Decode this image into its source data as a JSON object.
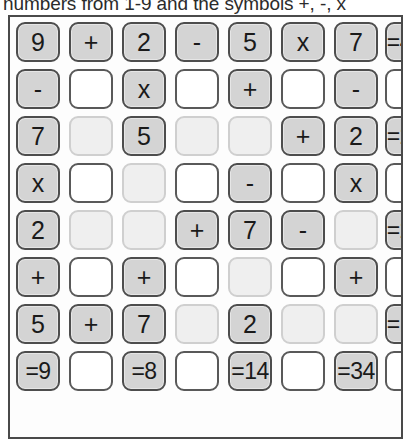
{
  "instruction": {
    "text": "se numbers from 1-9 and the symbols +, -, x"
  },
  "puzzle": {
    "title": "cross-number-puzzle-grid",
    "columns": 8,
    "rows": 8,
    "colors": {
      "given_fill": "#d4d4d4",
      "given_border": "#4d4d4d",
      "blank_faint_fill": "#efefef",
      "blank_faint_border": "#cfcfcf",
      "blank_white_fill": "#ffffff",
      "blank_white_border": "#595959",
      "frame_border": "#4a4a4a",
      "text": "#1a1a1a"
    },
    "grid": [
      [
        {
          "text": "9",
          "kind": "given"
        },
        {
          "text": "+",
          "kind": "given"
        },
        {
          "text": "2",
          "kind": "given"
        },
        {
          "text": "-",
          "kind": "given"
        },
        {
          "text": "5",
          "kind": "given"
        },
        {
          "text": "x",
          "kind": "given"
        },
        {
          "text": "7",
          "kind": "given"
        },
        {
          "text": "=42",
          "kind": "given"
        }
      ],
      [
        {
          "text": "-",
          "kind": "given"
        },
        {
          "text": "",
          "kind": "blank-white"
        },
        {
          "text": "x",
          "kind": "given"
        },
        {
          "text": "",
          "kind": "blank-white"
        },
        {
          "text": "+",
          "kind": "given"
        },
        {
          "text": "",
          "kind": "blank-white"
        },
        {
          "text": "-",
          "kind": "given"
        },
        {
          "text": "",
          "kind": "blank-white"
        }
      ],
      [
        {
          "text": "7",
          "kind": "given"
        },
        {
          "text": "",
          "kind": "blank-faint"
        },
        {
          "text": "5",
          "kind": "given"
        },
        {
          "text": "",
          "kind": "blank-faint"
        },
        {
          "text": "",
          "kind": "blank-faint"
        },
        {
          "text": "+",
          "kind": "given"
        },
        {
          "text": "2",
          "kind": "given"
        },
        {
          "text": "=20",
          "kind": "given"
        }
      ],
      [
        {
          "text": "x",
          "kind": "given"
        },
        {
          "text": "",
          "kind": "blank-white"
        },
        {
          "text": "",
          "kind": "blank-faint"
        },
        {
          "text": "",
          "kind": "blank-white"
        },
        {
          "text": "-",
          "kind": "given"
        },
        {
          "text": "",
          "kind": "blank-white"
        },
        {
          "text": "x",
          "kind": "given"
        },
        {
          "text": "",
          "kind": "blank-white"
        }
      ],
      [
        {
          "text": "2",
          "kind": "given"
        },
        {
          "text": "",
          "kind": "blank-faint"
        },
        {
          "text": "",
          "kind": "blank-faint"
        },
        {
          "text": "+",
          "kind": "given"
        },
        {
          "text": "7",
          "kind": "given"
        },
        {
          "text": "-",
          "kind": "given"
        },
        {
          "text": "",
          "kind": "blank-faint"
        },
        {
          "text": "=20",
          "kind": "given"
        }
      ],
      [
        {
          "text": "+",
          "kind": "given"
        },
        {
          "text": "",
          "kind": "blank-white"
        },
        {
          "text": "+",
          "kind": "given"
        },
        {
          "text": "",
          "kind": "blank-white"
        },
        {
          "text": "",
          "kind": "blank-faint"
        },
        {
          "text": "",
          "kind": "blank-white"
        },
        {
          "text": "+",
          "kind": "given"
        },
        {
          "text": "",
          "kind": "blank-white"
        }
      ],
      [
        {
          "text": "5",
          "kind": "given"
        },
        {
          "text": "+",
          "kind": "given"
        },
        {
          "text": "7",
          "kind": "given"
        },
        {
          "text": "",
          "kind": "blank-faint"
        },
        {
          "text": "2",
          "kind": "given"
        },
        {
          "text": "",
          "kind": "blank-faint"
        },
        {
          "text": "",
          "kind": "blank-faint"
        },
        {
          "text": "=15",
          "kind": "given"
        }
      ],
      [
        {
          "text": "=9",
          "kind": "given"
        },
        {
          "text": "",
          "kind": "blank-white"
        },
        {
          "text": "=8",
          "kind": "given"
        },
        {
          "text": "",
          "kind": "blank-white"
        },
        {
          "text": "=14",
          "kind": "given"
        },
        {
          "text": "",
          "kind": "blank-white"
        },
        {
          "text": "=34",
          "kind": "given"
        },
        {
          "text": "",
          "kind": "blank-white"
        }
      ]
    ]
  }
}
